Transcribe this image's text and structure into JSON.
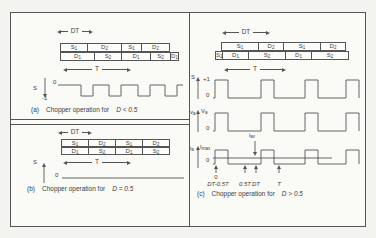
{
  "colors": {
    "ink": "#3c3c3c",
    "line": "#555555",
    "paper": "#f3f3f0",
    "panel": "#fafaf7"
  },
  "panel_a": {
    "dt_label": "DT",
    "t_label": "T",
    "rows": [
      {
        "x": 49,
        "y": 30,
        "h": 9,
        "cells": [
          {
            "b": "S",
            "s": "1",
            "w": 28
          },
          {
            "b": "D",
            "s": "2",
            "w": 35
          },
          {
            "b": "S",
            "s": "1",
            "w": 21
          },
          {
            "b": "D",
            "s": "2",
            "w": 29
          }
        ]
      },
      {
        "x": 49,
        "y": 39,
        "h": 9,
        "cells": [
          {
            "b": "D",
            "s": "1",
            "w": 35
          },
          {
            "b": "S",
            "s": "2",
            "w": 28
          },
          {
            "b": "D",
            "s": "1",
            "w": 30
          },
          {
            "b": "S",
            "s": "2",
            "w": 21
          },
          {
            "b": "D",
            "s": "1",
            "w": 9
          }
        ]
      }
    ],
    "axis": {
      "b": "S",
      "s": ""
    },
    "zero": "0",
    "neg_one": "-1",
    "tag": "(a)",
    "caption": "Chopper operation for",
    "condition": "D < 0.5",
    "shapes": [
      {
        "t": "varrow",
        "x": 34,
        "y0": 65,
        "y1": 85
      },
      {
        "t": "pulsetrain",
        "x0": 47,
        "x1": 172,
        "yb": 72,
        "yt": 83,
        "w": 12,
        "starts": [
          70,
          98,
          127,
          154
        ]
      }
    ]
  },
  "panel_b": {
    "dt_label": "DT",
    "t_label": "T",
    "rows": [
      {
        "x": 50,
        "y": 14,
        "h": 8,
        "cells": [
          {
            "b": "S",
            "s": "1",
            "w": 28
          },
          {
            "b": "D",
            "s": "2",
            "w": 28
          },
          {
            "b": "S",
            "s": "1",
            "w": 28
          },
          {
            "b": "D",
            "s": "2",
            "w": 28
          }
        ]
      },
      {
        "x": 50,
        "y": 22,
        "h": 8,
        "cells": [
          {
            "b": "D",
            "s": "1",
            "w": 28
          },
          {
            "b": "S",
            "s": "2",
            "w": 28
          },
          {
            "b": "D",
            "s": "1",
            "w": 28
          },
          {
            "b": "S",
            "s": "2",
            "w": 28
          }
        ]
      }
    ],
    "axis": {
      "b": "S",
      "s": ""
    },
    "zero": "0",
    "tag": "(b)",
    "caption": "Chopper operation for",
    "condition": "D = 0.5",
    "shapes": [
      {
        "t": "varrow",
        "x": 33,
        "y0": 58,
        "y1": 38
      },
      {
        "t": "hline",
        "x0": 51,
        "x1": 173,
        "y": 53
      }
    ]
  },
  "panel_c": {
    "dt_label": "DT",
    "t_label": "T",
    "rows": [
      {
        "x": 32,
        "y": 29,
        "h": 9,
        "cells": [
          {
            "b": "S",
            "s": "1",
            "w": 38
          },
          {
            "b": "D",
            "s": "2",
            "w": 26
          },
          {
            "b": "S",
            "s": "1",
            "w": 38
          },
          {
            "b": "D",
            "s": "2",
            "w": 26
          }
        ]
      },
      {
        "x": 26,
        "y": 38,
        "h": 9,
        "cells": [
          {
            "b": "S",
            "s": "2",
            "w": 8
          },
          {
            "b": "D",
            "s": "1",
            "w": 27
          },
          {
            "b": "S",
            "s": "2",
            "w": 38
          },
          {
            "b": "D",
            "s": "1",
            "w": 27
          },
          {
            "b": "S",
            "s": "2",
            "w": 38
          }
        ]
      }
    ],
    "wf1": {
      "axis": {
        "b": "S",
        "s": ""
      },
      "plus_one": "+1",
      "zero": "0"
    },
    "wf2": {
      "axis": {
        "b": "v",
        "s": "a"
      },
      "level": {
        "b": "V",
        "s": "a"
      },
      "zero": "0"
    },
    "wf3": {
      "axis": {
        "b": "i",
        "s": "a"
      },
      "level": {
        "b": "I",
        "s": "max"
      },
      "zero": "0",
      "annotation": {
        "b": "i",
        "s": "av"
      }
    },
    "time_labels": {
      "zero": "0",
      "t1": "DT-0.5T",
      "t2": "0.5T",
      "t3": "DT",
      "t4": "T"
    },
    "tag": "(c)",
    "caption": "Chopper operation for",
    "condition": "D > 0.5",
    "shapes": [
      {
        "t": "varrow",
        "x": 9,
        "y0": 86,
        "y1": 64
      },
      {
        "t": "pulsetrain",
        "x0": 24,
        "x1": 170,
        "yb": 85,
        "yt": 67,
        "w": 13,
        "starts": [
          26,
          72,
          116,
          157
        ]
      },
      {
        "t": "varrow",
        "x": 9,
        "y0": 119,
        "y1": 97
      },
      {
        "t": "pulsetrain",
        "x0": 24,
        "x1": 170,
        "yb": 118,
        "yt": 100,
        "w": 13,
        "starts": [
          26,
          72,
          116,
          157
        ]
      },
      {
        "t": "varrow",
        "x": 9,
        "y0": 155,
        "y1": 133
      },
      {
        "t": "pulsetrain",
        "x0": 24,
        "x1": 170,
        "yb": 151,
        "yt": 137,
        "w": 13,
        "starts": [
          26,
          72,
          116,
          157
        ]
      },
      {
        "t": "hline",
        "x0": 24,
        "x1": 143,
        "y": 145
      },
      {
        "t": "varrow",
        "x": 66,
        "y0": 128,
        "y1": 143
      },
      {
        "t": "varrow",
        "x": 27,
        "y0": 160,
        "y1": 152
      },
      {
        "t": "varrow",
        "x": 56,
        "y0": 160,
        "y1": 152
      },
      {
        "t": "varrow",
        "x": 67,
        "y0": 160,
        "y1": 152
      },
      {
        "t": "varrow",
        "x": 90,
        "y0": 160,
        "y1": 152
      }
    ]
  }
}
